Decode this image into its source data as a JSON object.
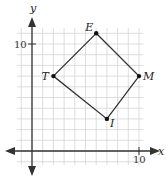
{
  "diagram": {
    "type": "coordinate-plane-quadrilateral",
    "axes": {
      "x_label": "x",
      "y_label": "y",
      "x_tick_label": "10",
      "y_tick_label": "10"
    },
    "grid": {
      "xmin": -1.5,
      "xmax": 10.5,
      "ymin": -1.5,
      "ymax": 11.5
    },
    "points": [
      {
        "name": "E",
        "x": 6,
        "y": 11
      },
      {
        "name": "M",
        "x": 10,
        "y": 7
      },
      {
        "name": "I",
        "x": 7,
        "y": 3
      },
      {
        "name": "T",
        "x": 2,
        "y": 7
      }
    ],
    "colors": {
      "grid": "#d0d0d0",
      "axis": "#333333",
      "shape": "#333333"
    }
  }
}
